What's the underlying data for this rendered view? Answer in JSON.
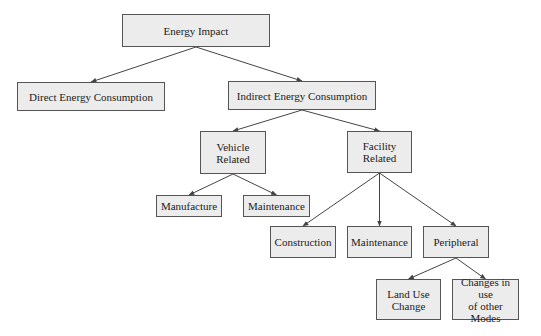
{
  "diagram": {
    "type": "tree",
    "colors": {
      "box_fill": "#ececec",
      "box_border": "#555555",
      "edge": "#444444",
      "background": "#ffffff"
    },
    "nodes": [
      {
        "id": "root",
        "label": "Energy Impact",
        "x": 122,
        "y": 14,
        "w": 148,
        "h": 33
      },
      {
        "id": "direct",
        "label": "Direct Energy Consumption",
        "x": 17,
        "y": 82,
        "w": 148,
        "h": 29
      },
      {
        "id": "indirect",
        "label": "Indirect Energy Consumption",
        "x": 228,
        "y": 81,
        "w": 148,
        "h": 29
      },
      {
        "id": "vehicle",
        "label": "Vehicle\nRelated",
        "x": 200,
        "y": 131,
        "w": 66,
        "h": 43
      },
      {
        "id": "facility",
        "label": "Facility\nRelated",
        "x": 347,
        "y": 131,
        "w": 65,
        "h": 42
      },
      {
        "id": "manufacture",
        "label": "Manufacture",
        "x": 156,
        "y": 195,
        "w": 66,
        "h": 22
      },
      {
        "id": "maint_vehicle",
        "label": "Maintenance",
        "x": 243,
        "y": 195,
        "w": 67,
        "h": 22
      },
      {
        "id": "construction",
        "label": "Construction",
        "x": 270,
        "y": 226,
        "w": 66,
        "h": 32
      },
      {
        "id": "maint_facility",
        "label": "Maintenance",
        "x": 347,
        "y": 226,
        "w": 65,
        "h": 32
      },
      {
        "id": "peripheral",
        "label": "Peripheral",
        "x": 423,
        "y": 226,
        "w": 66,
        "h": 32
      },
      {
        "id": "landuse",
        "label": "Land Use\nChange",
        "x": 376,
        "y": 279,
        "w": 65,
        "h": 41
      },
      {
        "id": "othermodes",
        "label": "Changes in use\nof other Modes",
        "x": 452,
        "y": 279,
        "w": 67,
        "h": 41
      }
    ],
    "edges": [
      {
        "from": "root",
        "to": "direct"
      },
      {
        "from": "root",
        "to": "indirect"
      },
      {
        "from": "indirect",
        "to": "vehicle"
      },
      {
        "from": "indirect",
        "to": "facility"
      },
      {
        "from": "vehicle",
        "to": "manufacture"
      },
      {
        "from": "vehicle",
        "to": "maint_vehicle"
      },
      {
        "from": "facility",
        "to": "construction"
      },
      {
        "from": "facility",
        "to": "maint_facility"
      },
      {
        "from": "facility",
        "to": "peripheral"
      },
      {
        "from": "peripheral",
        "to": "landuse"
      },
      {
        "from": "peripheral",
        "to": "othermodes"
      }
    ]
  }
}
